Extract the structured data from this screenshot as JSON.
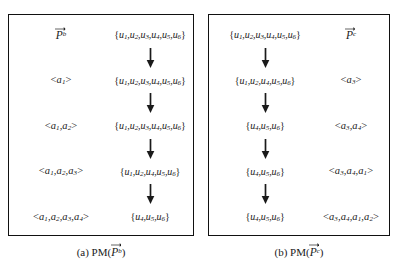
{
  "figure": {
    "panels": [
      {
        "id": "panel-a",
        "layout": "label-left-set-right",
        "vector_label": "P",
        "vector_superscript": "b",
        "caption_prefix": "(a)",
        "caption_fn": "PM",
        "caption_arg": "P",
        "caption_arg_superscript": "b",
        "rows": [
          {
            "label_kind": "vector",
            "label_text": "P",
            "label_sup": "b",
            "set": [
              "u1",
              "u2",
              "u3",
              "u4",
              "u5",
              "u6"
            ]
          },
          {
            "label_kind": "sequence",
            "sequence": [
              "a1"
            ],
            "set": [
              "u1",
              "u2",
              "u3",
              "u4",
              "u5",
              "u6"
            ]
          },
          {
            "label_kind": "sequence",
            "sequence": [
              "a1",
              "a2"
            ],
            "set": [
              "u1",
              "u2",
              "u3",
              "u4",
              "u5",
              "u6"
            ]
          },
          {
            "label_kind": "sequence",
            "sequence": [
              "a1",
              "a2",
              "a3"
            ],
            "set": [
              "u1",
              "u2",
              "u4",
              "u5",
              "u6"
            ]
          },
          {
            "label_kind": "sequence",
            "sequence": [
              "a1",
              "a2",
              "a3",
              "a4"
            ],
            "set": [
              "u4",
              "u5",
              "u6"
            ]
          }
        ]
      },
      {
        "id": "panel-b",
        "layout": "set-left-label-right",
        "vector_label": "P",
        "vector_superscript": "c",
        "caption_prefix": "(b)",
        "caption_fn": "PM",
        "caption_arg": "P",
        "caption_arg_superscript": "c",
        "rows": [
          {
            "label_kind": "vector",
            "label_text": "P",
            "label_sup": "c",
            "set": [
              "u1",
              "u2",
              "u3",
              "u4",
              "u5",
              "u6"
            ]
          },
          {
            "label_kind": "sequence",
            "sequence": [
              "a3"
            ],
            "set": [
              "u1",
              "u2",
              "u4",
              "u5",
              "u6"
            ]
          },
          {
            "label_kind": "sequence",
            "sequence": [
              "a3",
              "a4"
            ],
            "set": [
              "u4",
              "u5",
              "u6"
            ]
          },
          {
            "label_kind": "sequence",
            "sequence": [
              "a3",
              "a4",
              "a1"
            ],
            "set": [
              "u4",
              "u5",
              "u6"
            ]
          },
          {
            "label_kind": "sequence",
            "sequence": [
              "a3",
              "a4",
              "a1",
              "a2"
            ],
            "set": [
              "u4",
              "u5",
              "u6"
            ]
          }
        ]
      }
    ],
    "arrow_count_per_panel": 4,
    "colors": {
      "border": "#111111",
      "text": "#1a1a1a",
      "background": "#ffffff"
    }
  }
}
